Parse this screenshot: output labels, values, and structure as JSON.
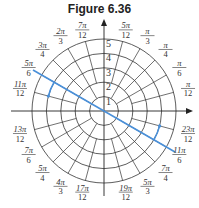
{
  "figure": {
    "title": "Figure 6.36",
    "center": [
      104,
      111
    ],
    "ring_spacing_px": 14.4,
    "radial_ticks": [
      "1",
      "2",
      "3",
      "4",
      "5"
    ],
    "angle_labels": [
      {
        "num": "π",
        "den": "12",
        "angle_deg": 15
      },
      {
        "num": "π",
        "den": "6",
        "angle_deg": 30
      },
      {
        "num": "π",
        "den": "4",
        "angle_deg": 45
      },
      {
        "num": "π",
        "den": "3",
        "angle_deg": 60
      },
      {
        "num": "5π",
        "den": "12",
        "angle_deg": 75
      },
      {
        "num": "7π",
        "den": "12",
        "angle_deg": 105
      },
      {
        "num": "2π",
        "den": "3",
        "angle_deg": 120
      },
      {
        "num": "3π",
        "den": "4",
        "angle_deg": 135
      },
      {
        "num": "5π",
        "den": "6",
        "angle_deg": 150
      },
      {
        "num": "11π",
        "den": "12",
        "angle_deg": 165
      },
      {
        "num": "13π",
        "den": "12",
        "angle_deg": 195
      },
      {
        "num": "7π",
        "den": "6",
        "angle_deg": 210
      },
      {
        "num": "5π",
        "den": "4",
        "angle_deg": 225
      },
      {
        "num": "4π",
        "den": "3",
        "angle_deg": 240
      },
      {
        "num": "17π",
        "den": "12",
        "angle_deg": 255
      },
      {
        "num": "19π",
        "den": "12",
        "angle_deg": 285
      },
      {
        "num": "5π",
        "den": "3",
        "angle_deg": 300
      },
      {
        "num": "7π",
        "den": "4",
        "angle_deg": 315
      },
      {
        "num": "11π",
        "den": "6",
        "angle_deg": 330
      },
      {
        "num": "23π",
        "den": "12",
        "angle_deg": 345
      }
    ],
    "highlight": {
      "color": "#4a90d9",
      "line_angles_deg": [
        150,
        330
      ],
      "arc_radius": 4,
      "arcs_deg": [
        [
          150,
          165
        ],
        [
          330,
          345
        ]
      ]
    },
    "grid_color": "#333333",
    "axis_color": "#222222"
  }
}
